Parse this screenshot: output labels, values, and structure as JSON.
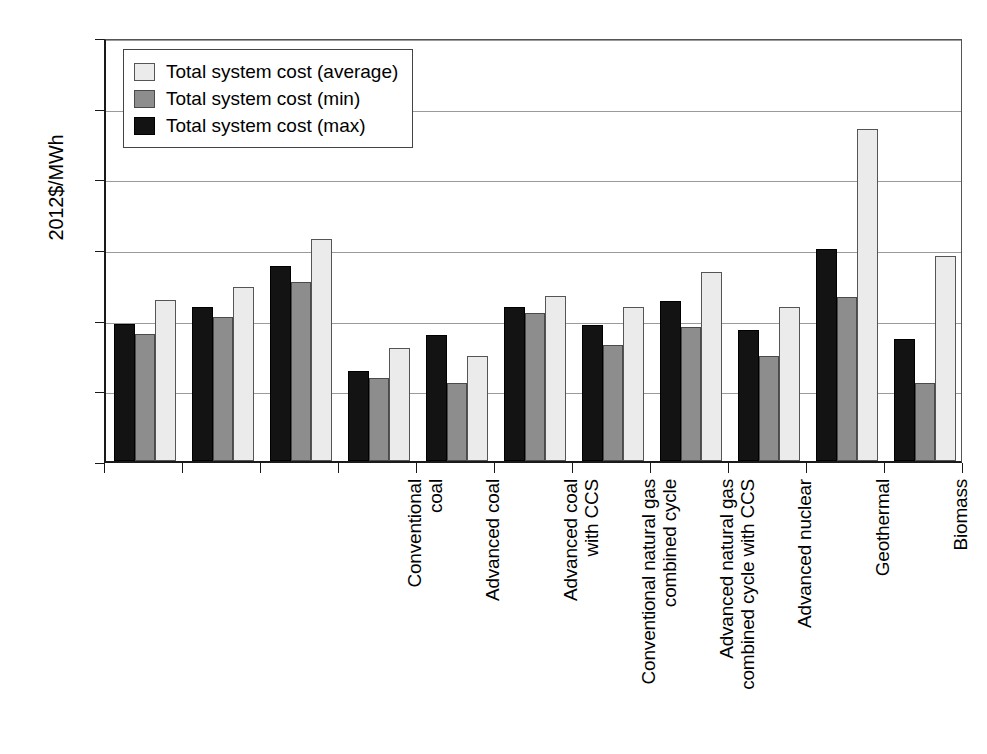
{
  "chart_data": {
    "type": "bar",
    "title": "",
    "xlabel": "",
    "ylabel": "2012$/MWh",
    "ylim": [
      0,
      300
    ],
    "yticks": [
      0,
      50,
      100,
      150,
      200,
      250,
      300
    ],
    "ytick_labels": [
      "0",
      "50",
      "100",
      "150",
      "200",
      "250",
      "300"
    ],
    "grid": "horizontal",
    "legend_position": "upper-left-inside",
    "categories": [
      "Conventional\ncoal",
      "Advanced coal",
      "Advanced coal\nwith CCS",
      "Conventional natural gas\ncombined cycle",
      "Advanced natural gas\ncombined cycle with CCS",
      "Advanced nuclear",
      "Geothermal",
      "Biomass",
      "Wind",
      "Solar PV (utility)",
      "Hydro"
    ],
    "series": [
      {
        "name": "Total system cost (max)",
        "color": "#131313",
        "values": [
          97,
          109,
          138,
          64,
          89,
          109,
          96,
          113,
          93,
          150,
          86
        ]
      },
      {
        "name": "Total system cost (min)",
        "color": "#8d8d8d",
        "values": [
          90,
          102,
          127,
          59,
          55,
          105,
          82,
          95,
          74,
          116,
          55
        ]
      },
      {
        "name": "Total system cost (average)",
        "color": "#ebebeb",
        "values": [
          114,
          123,
          157,
          80,
          74,
          117,
          109,
          134,
          109,
          235,
          145
        ]
      }
    ],
    "bar_order_in_group": [
      "max",
      "min",
      "average"
    ],
    "legend_entries": [
      "Total system cost (average)",
      "Total system cost (min)",
      "Total system cost (max)"
    ]
  }
}
